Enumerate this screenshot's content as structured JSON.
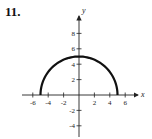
{
  "problem": {
    "number": "11."
  },
  "chart_data": {
    "type": "line",
    "title": "",
    "xlabel": "x",
    "ylabel": "y",
    "xlim": [
      -7,
      7.5
    ],
    "ylim": [
      -5,
      10
    ],
    "grid": false,
    "legend": null,
    "x_ticks": [
      -6,
      -4,
      -2,
      2,
      4,
      6
    ],
    "y_ticks": [
      8,
      6,
      4,
      2,
      -2,
      -4
    ],
    "x_tick_labels": [
      "-6",
      "-4",
      "-2",
      "2",
      "4",
      "6"
    ],
    "y_tick_labels": [
      "8",
      "6",
      "4",
      "2",
      "-2",
      "-4"
    ],
    "series": [
      {
        "name": "upper semicircle y = sqrt(25 - x^2)",
        "x": [
          -5,
          -4,
          -3,
          -2,
          -1,
          0,
          1,
          2,
          3,
          4,
          5
        ],
        "y": [
          0,
          3,
          4,
          4.58,
          4.9,
          5,
          4.9,
          4.58,
          4,
          3,
          0
        ]
      }
    ]
  },
  "colors": {
    "curve": "#111111",
    "axes": "#222222"
  }
}
